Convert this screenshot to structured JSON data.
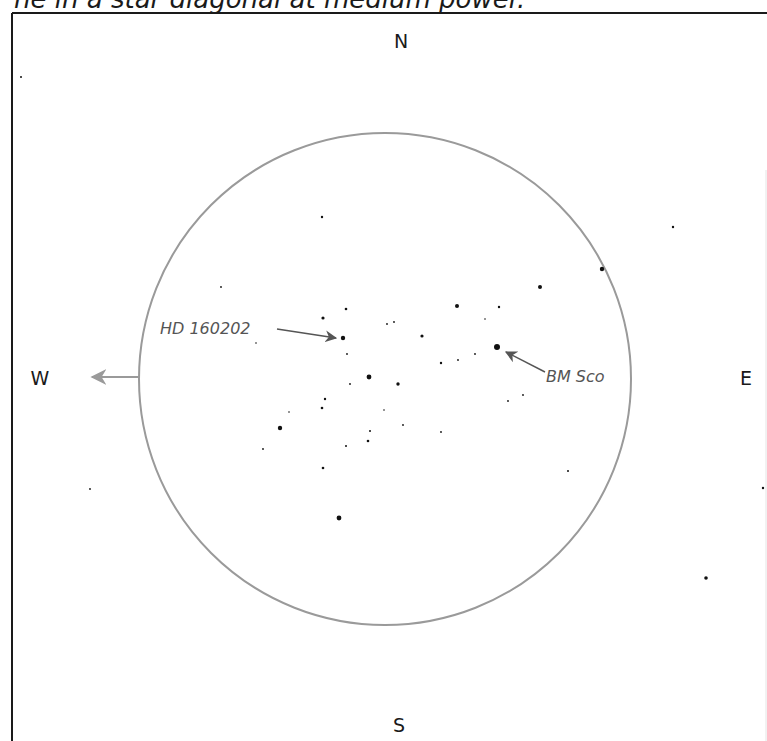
{
  "caption": "ne in a star diagonal at medium power.",
  "compass": {
    "north": "N",
    "south": "S",
    "east": "E",
    "west": "W"
  },
  "field_of_view": {
    "center_x": 385,
    "center_y": 379,
    "radius": 246,
    "stroke_color": "#9a9a9a"
  },
  "frame": {
    "border_color": "#1a1a1a"
  },
  "labels": [
    {
      "id": "hd160202",
      "text": "HD 160202",
      "x": 160,
      "y": 334,
      "arrow_from": [
        277,
        329
      ],
      "arrow_to": [
        336,
        338
      ],
      "target_star": [
        343,
        338
      ]
    },
    {
      "id": "bmsco",
      "text": "BM Sco",
      "x": 546,
      "y": 382,
      "arrow_from": [
        545,
        372
      ],
      "arrow_to": [
        506,
        352
      ],
      "target_star": [
        497,
        347
      ]
    }
  ],
  "direction_arrow": {
    "from": [
      139,
      377
    ],
    "to": [
      92,
      377
    ],
    "color": "#9a9a9a"
  },
  "stars": [
    {
      "x": 21,
      "y": 77,
      "r": 1.0
    },
    {
      "x": 322,
      "y": 217,
      "r": 1.2
    },
    {
      "x": 673,
      "y": 227,
      "r": 1.2
    },
    {
      "x": 602,
      "y": 269,
      "r": 2.2
    },
    {
      "x": 540,
      "y": 287,
      "r": 2.0
    },
    {
      "x": 221,
      "y": 287,
      "r": 0.9
    },
    {
      "x": 457,
      "y": 306,
      "r": 2.0
    },
    {
      "x": 499,
      "y": 307,
      "r": 1.2
    },
    {
      "x": 346,
      "y": 309,
      "r": 1.3
    },
    {
      "x": 323,
      "y": 318,
      "r": 1.6
    },
    {
      "x": 485,
      "y": 319,
      "r": 0.8
    },
    {
      "x": 387,
      "y": 324,
      "r": 0.9
    },
    {
      "x": 394,
      "y": 322,
      "r": 0.9
    },
    {
      "x": 422,
      "y": 336,
      "r": 1.6
    },
    {
      "x": 343,
      "y": 338,
      "r": 2.2
    },
    {
      "x": 256,
      "y": 343,
      "r": 0.8
    },
    {
      "x": 497,
      "y": 347,
      "r": 3.0
    },
    {
      "x": 475,
      "y": 354,
      "r": 0.9
    },
    {
      "x": 347,
      "y": 354,
      "r": 0.9
    },
    {
      "x": 458,
      "y": 360,
      "r": 0.9
    },
    {
      "x": 441,
      "y": 363,
      "r": 1.2
    },
    {
      "x": 369,
      "y": 377,
      "r": 2.4
    },
    {
      "x": 398,
      "y": 384,
      "r": 1.7
    },
    {
      "x": 350,
      "y": 384,
      "r": 0.9
    },
    {
      "x": 523,
      "y": 395,
      "r": 0.9
    },
    {
      "x": 325,
      "y": 399,
      "r": 1.2
    },
    {
      "x": 508,
      "y": 401,
      "r": 0.9
    },
    {
      "x": 322,
      "y": 408,
      "r": 1.3
    },
    {
      "x": 384,
      "y": 410,
      "r": 0.8
    },
    {
      "x": 289,
      "y": 412,
      "r": 0.8
    },
    {
      "x": 403,
      "y": 425,
      "r": 0.9
    },
    {
      "x": 280,
      "y": 428,
      "r": 2.2
    },
    {
      "x": 370,
      "y": 431,
      "r": 1.0
    },
    {
      "x": 441,
      "y": 432,
      "r": 0.9
    },
    {
      "x": 368,
      "y": 441,
      "r": 1.3
    },
    {
      "x": 346,
      "y": 446,
      "r": 1.0
    },
    {
      "x": 263,
      "y": 449,
      "r": 0.9
    },
    {
      "x": 323,
      "y": 468,
      "r": 1.3
    },
    {
      "x": 568,
      "y": 471,
      "r": 1.0
    },
    {
      "x": 763,
      "y": 488,
      "r": 1.2
    },
    {
      "x": 90,
      "y": 489,
      "r": 0.9
    },
    {
      "x": 339,
      "y": 518,
      "r": 2.4
    },
    {
      "x": 706,
      "y": 578,
      "r": 1.8
    }
  ]
}
